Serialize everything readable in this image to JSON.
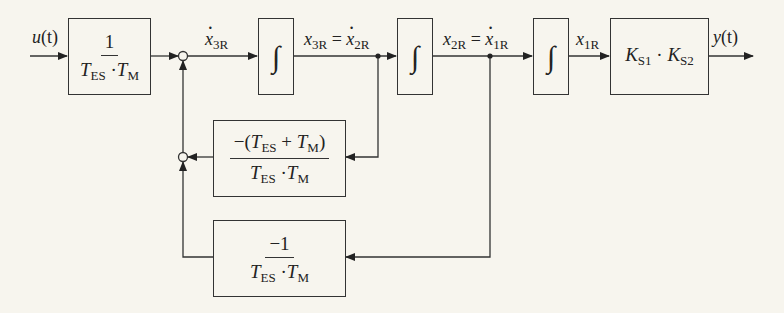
{
  "diagram": {
    "type": "signal-flow block diagram",
    "input_signal": "u(t)",
    "output_signal": "y(t)",
    "blocks": [
      {
        "id": "gain-input",
        "numerator": "1",
        "denominator_parts": [
          "T",
          "ES",
          "·",
          "T",
          "M"
        ]
      },
      {
        "id": "integrator-1",
        "symbol": "∫"
      },
      {
        "id": "integrator-2",
        "symbol": "∫"
      },
      {
        "id": "integrator-3",
        "symbol": "∫"
      },
      {
        "id": "gain-output",
        "parts": [
          "K",
          "S1",
          "·",
          "K",
          "S2"
        ]
      },
      {
        "id": "feedback-1",
        "numerator_parts": [
          "−(",
          "T",
          "ES",
          " + ",
          "T",
          "M",
          ")"
        ],
        "denominator_parts": [
          "T",
          "ES",
          "·",
          "T",
          "M"
        ]
      },
      {
        "id": "feedback-2",
        "numerator": "−1",
        "denominator_parts": [
          "T",
          "ES",
          "·",
          "T",
          "M"
        ]
      }
    ],
    "signals": {
      "u": {
        "base": "u",
        "arg": "(t)"
      },
      "x3R_dot": {
        "base": "x",
        "sub": "3R"
      },
      "x3R_eq": {
        "base": "x",
        "sub": "3R",
        "eq": " = ",
        "base2": "x",
        "sub2": "2R"
      },
      "x2R_eq": {
        "base": "x",
        "sub": "2R",
        "eq": " = ",
        "base2": "x",
        "sub2": "1R"
      },
      "x1R": {
        "base": "x",
        "sub": "1R"
      },
      "y": {
        "base": "y",
        "arg": "(t)"
      }
    },
    "colors": {
      "line": "#333333",
      "background": "#f7f5ee"
    }
  }
}
